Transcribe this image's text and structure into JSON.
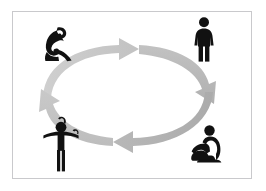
{
  "top_strip": {
    "text": "                             "
  },
  "panel": {
    "background_color": "#ffffff",
    "border_color": "#c9c9cc"
  },
  "diagram": {
    "type": "cycle",
    "direction": "clockwise",
    "ring_color_light": "#c9c9c9",
    "ring_color_dark": "#a8a8a8",
    "figure_color": "#111111",
    "arrows": [
      {
        "name": "arrow-top",
        "points": "right",
        "color": "#c9c9c9"
      },
      {
        "name": "arrow-right",
        "points": "down-right",
        "color": "#b4b4b4"
      },
      {
        "name": "arrow-bottom",
        "points": "left",
        "color": "#aeaeae"
      },
      {
        "name": "arrow-left",
        "points": "up-left",
        "color": "#bcbcbc"
      }
    ],
    "figures": [
      {
        "name": "figure-hunched-sitting",
        "pose": "sitting hunched forward, head bowed",
        "position": "top-left"
      },
      {
        "name": "figure-standing",
        "pose": "standing upright",
        "position": "top-right"
      },
      {
        "name": "figure-sitting-knees-up",
        "pose": "sitting on ground, knees drawn up, arms around legs",
        "position": "bottom-right"
      },
      {
        "name": "figure-hands-on-head",
        "pose": "standing with hands raised to head",
        "position": "bottom-left"
      }
    ]
  }
}
